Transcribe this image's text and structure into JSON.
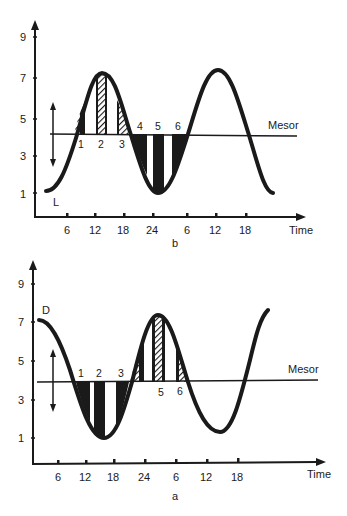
{
  "panels": [
    {
      "id": "b",
      "caption": "b",
      "curve_label": "L",
      "mesor_label": "Mesor",
      "x_axis_title": "Time",
      "y_ticks": [
        "9",
        "7",
        "5",
        "3",
        "1"
      ],
      "x_ticks": [
        "6",
        "12",
        "18",
        "24",
        "6",
        "12",
        "18"
      ],
      "segment_labels": [
        "1",
        "2",
        "3",
        "4",
        "5",
        "6"
      ]
    },
    {
      "id": "a",
      "caption": "a",
      "curve_label": "D",
      "mesor_label": "Mesor",
      "x_axis_title": "Time",
      "y_ticks": [
        "9",
        "7",
        "5",
        "3",
        "1"
      ],
      "x_ticks": [
        "6",
        "12",
        "18",
        "24",
        "6",
        "12",
        "18"
      ],
      "segment_labels": [
        "1",
        "2",
        "3",
        "5",
        "6"
      ]
    }
  ],
  "colors": {
    "ink": "#1a1a1a",
    "background": "#ffffff"
  }
}
